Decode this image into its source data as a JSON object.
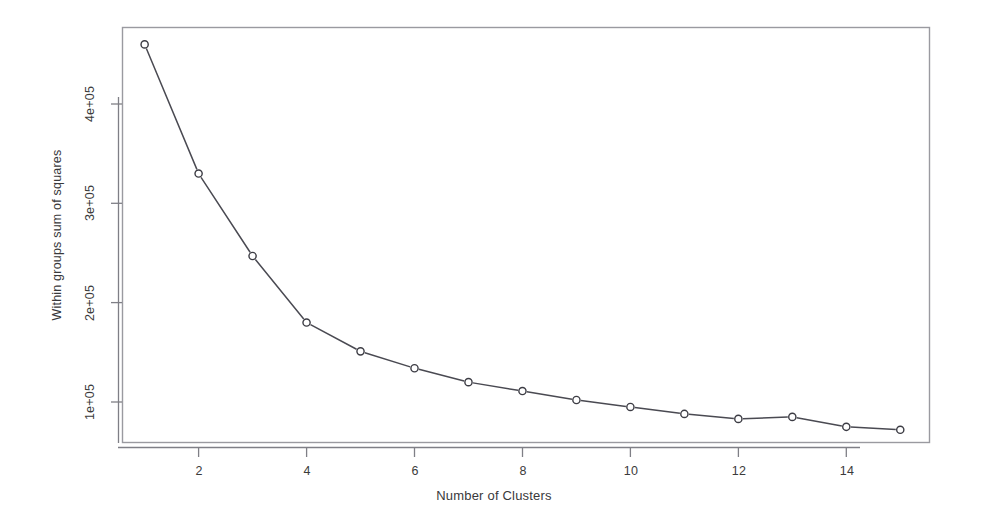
{
  "chart_data": {
    "type": "line",
    "title": "",
    "subtitle": "",
    "xlabel": "Number of Clusters",
    "ylabel": "Within groups sum of squares",
    "x": [
      1,
      2,
      3,
      4,
      5,
      6,
      7,
      8,
      9,
      10,
      11,
      12,
      13,
      14,
      15
    ],
    "values": [
      460000,
      330000,
      247000,
      180000,
      151000,
      134000,
      120000,
      111000,
      102000,
      95000,
      88000,
      83000,
      85000,
      75000,
      72000
    ],
    "series": [
      {
        "name": "Within groups sum of squares",
        "values": [
          460000,
          330000,
          247000,
          180000,
          151000,
          134000,
          120000,
          111000,
          102000,
          95000,
          88000,
          83000,
          85000,
          75000,
          72000
        ]
      }
    ],
    "xlim": [
      0.58,
      15.42
    ],
    "ylim": [
      58000,
      478000
    ],
    "xticks": [
      2,
      4,
      6,
      8,
      10,
      12,
      14
    ],
    "xtick_labels": [
      "2",
      "4",
      "6",
      "8",
      "10",
      "12",
      "14"
    ],
    "yticks": [
      100000,
      200000,
      300000,
      400000
    ],
    "ytick_labels": [
      "1e+05",
      "2e+05",
      "3e+05",
      "4e+05"
    ],
    "grid": false,
    "legend": false,
    "legend_position": "none",
    "marker": "open-circle",
    "line_color": "#4a4a52",
    "marker_color": "#3c3c44",
    "box_color": "#8a8a90",
    "annotations": []
  },
  "axes": {
    "x_title": "Number of Clusters",
    "y_title": "Within groups sum of squares",
    "x_tick_labels": [
      "2",
      "4",
      "6",
      "8",
      "10",
      "12",
      "14"
    ],
    "y_tick_labels": [
      "1e+05",
      "2e+05",
      "3e+05",
      "4e+05"
    ]
  }
}
